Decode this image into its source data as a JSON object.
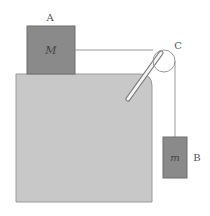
{
  "diagram": {
    "type": "pulley-system",
    "labels": {
      "block_a": "A",
      "block_b": "B",
      "pulley": "C"
    },
    "masses": {
      "block_a": "M",
      "block_b": "m"
    },
    "colors": {
      "table": "#c8c8c8",
      "table_edge": "#9a9a9a",
      "block": "#8a8a8a",
      "block_edge": "#6e6e6e",
      "string": "#9a9a9a",
      "pulley": "#9a9a9a",
      "background": "#ffffff"
    }
  }
}
